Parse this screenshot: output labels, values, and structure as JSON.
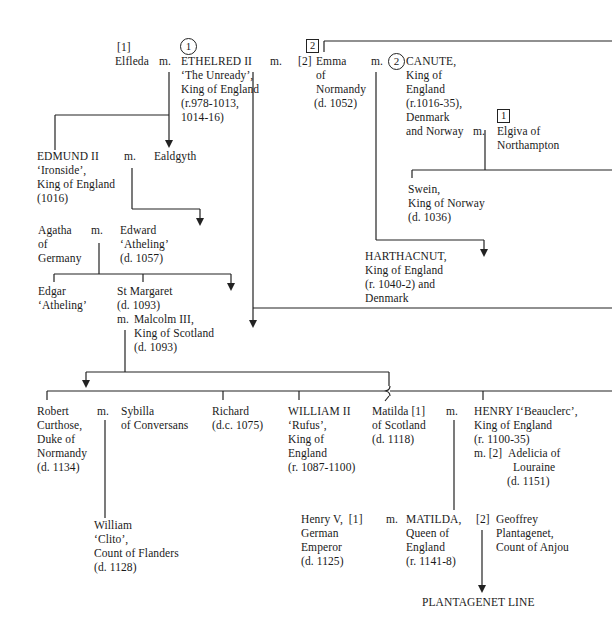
{
  "tree": {
    "row1": {
      "elfleda": {
        "marker": "[1]",
        "name": "Elfleda"
      },
      "m1": "m.",
      "ethelred": {
        "marker": "1",
        "lines": [
          "ETHELRED II",
          "‘The Unready’,",
          "King of England",
          "(r.978-1013,",
          "1014-16)"
        ]
      },
      "m2": "m.",
      "emma": {
        "marker_box": "2",
        "marker": "[2]",
        "lines": [
          "Emma",
          "of",
          "Normandy",
          "(d. 1052)"
        ]
      },
      "m3": "m.",
      "canute": {
        "marker": "2",
        "lines": [
          "CANUTE,",
          "King of",
          "England",
          "(r.1016-35),",
          "Denmark",
          "and Norway"
        ]
      },
      "m4": "m.",
      "elgiva": {
        "marker_box": "1",
        "lines": [
          "Elgiva of",
          "Northampton"
        ]
      }
    },
    "row2": {
      "edmund": {
        "lines": [
          "EDMUND II",
          "‘Ironside’,",
          "King of England",
          "(1016)"
        ]
      },
      "m": "m.",
      "ealdgyth": {
        "lines": [
          "Ealdgyth"
        ]
      },
      "swein": {
        "lines": [
          "Swein,",
          "King of Norway",
          "(d. 1036)"
        ]
      }
    },
    "row3": {
      "agatha": {
        "lines": [
          "Agatha",
          "of",
          "Germany"
        ]
      },
      "m": "m.",
      "edward": {
        "lines": [
          "Edward",
          "‘Atheling’",
          "(d. 1057)"
        ]
      },
      "harthacnut": {
        "lines": [
          "HARTHACNUT,",
          "King of England",
          "(r. 1040-2) and",
          "Denmark"
        ]
      }
    },
    "row4": {
      "edgar": {
        "lines": [
          "Edgar",
          "‘Atheling’"
        ]
      },
      "margaret": {
        "lines": [
          "St Margaret",
          "(d. 1093)"
        ]
      },
      "malcolm": {
        "prefix": "m.",
        "lines": [
          "Malcolm III,",
          "King of Scotland",
          "(d. 1093)"
        ]
      }
    },
    "row5": {
      "robert": {
        "lines": [
          "Robert",
          "Curthose,",
          "Duke of",
          "Normandy",
          "(d. 1134)"
        ]
      },
      "m1": "m.",
      "sybilla": {
        "lines": [
          "Sybilla",
          "of Conversans"
        ]
      },
      "richard": {
        "lines": [
          "Richard",
          "(d.c. 1075)"
        ]
      },
      "william2": {
        "lines": [
          "WILLIAM II",
          "‘Rufus’,",
          "King of",
          "England",
          "(r. 1087-1100)"
        ]
      },
      "matilda_scot": {
        "lines": [
          "Matilda [1]",
          "of Scotland",
          "(d. 1118)"
        ]
      },
      "m2": "m.",
      "henry1": {
        "lines": [
          "HENRY I‘Beauclerc’,",
          "King of England",
          "(r. 1100-35)"
        ]
      },
      "adelicia": {
        "prefix": "m. [2]",
        "lines": [
          "Adelicia of",
          "Louraine",
          "(d. 1151)"
        ]
      }
    },
    "row6": {
      "william_clito": {
        "lines": [
          "William",
          "‘Clito’,",
          "Count of Flanders",
          "(d. 1128)"
        ]
      },
      "henry5": {
        "lines": [
          "Henry V,  [1]",
          "German",
          "Emperor",
          "(d. 1125)"
        ]
      },
      "m": "m.",
      "matilda": {
        "lines": [
          "MATILDA,",
          "Queen of",
          "England",
          "(r. 1141-8)"
        ]
      },
      "geoffrey": {
        "marker": "[2]",
        "lines": [
          "Geoffrey",
          "Plantagenet,",
          "Count of Anjou"
        ]
      }
    },
    "footer": {
      "plantagenet": "PLANTAGENET LINE"
    }
  }
}
